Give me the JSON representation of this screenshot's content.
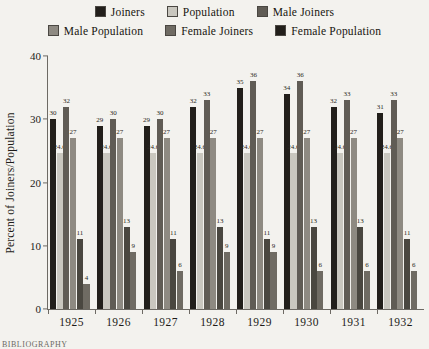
{
  "chart_data": {
    "type": "bar",
    "title": "",
    "xlabel": "",
    "ylabel": "Percent of Joiners/Population",
    "ylim": [
      0,
      40
    ],
    "yticks": [
      0,
      10,
      20,
      30,
      40
    ],
    "grid": false,
    "legend_position": "top",
    "categories": [
      "1925",
      "1926",
      "1927",
      "1928",
      "1929",
      "1930",
      "1931",
      "1932"
    ],
    "series": [
      {
        "name": "Joiners",
        "color": "#221f1b",
        "values": [
          30,
          29,
          29,
          32,
          35,
          34,
          32,
          31
        ],
        "labels": [
          "30",
          "29",
          "29",
          "32",
          "35",
          "34",
          "32",
          "31"
        ]
      },
      {
        "name": "Population",
        "color": "#c9c7bf",
        "values": [
          24.6,
          24.6,
          24.6,
          24.6,
          24.6,
          24.6,
          24.6,
          24.6
        ],
        "labels": [
          "24.6",
          "24.6",
          "24.6",
          "24.6",
          "24.6",
          "24.6",
          "24.6",
          "24.6"
        ]
      },
      {
        "name": "Male Joiners",
        "color": "#605c55",
        "values": [
          32,
          30,
          30,
          33,
          36,
          36,
          33,
          33
        ],
        "labels": [
          "32",
          "30",
          "30",
          "33",
          "36",
          "36",
          "33",
          "33"
        ]
      },
      {
        "name": "Male Population",
        "color": "#8e8a82",
        "values": [
          27,
          27,
          27,
          27,
          27,
          27,
          27,
          27
        ],
        "labels": [
          "27",
          "27",
          "27",
          "27",
          "27",
          "27",
          "27",
          "27"
        ]
      },
      {
        "name": "Female Joiners",
        "color": "#4a4740",
        "values": [
          11,
          13,
          11,
          13,
          11,
          13,
          13,
          11
        ],
        "labels": [
          "11",
          "13",
          "11",
          "13",
          "11",
          "13",
          "13",
          "11"
        ]
      },
      {
        "name": "Female Population",
        "color": "#6f6b63",
        "values": [
          4,
          9,
          6,
          9,
          9,
          6,
          6,
          6
        ],
        "labels": [
          "4",
          "9",
          "6",
          "9",
          "9",
          "6",
          "6",
          "6"
        ]
      }
    ]
  },
  "legend": {
    "rows": [
      [
        {
          "label": "Joiners",
          "color": "#221f1b"
        },
        {
          "label": "Population",
          "color": "#c9c7bf"
        },
        {
          "label": "Male Joiners",
          "color": "#605c55"
        }
      ],
      [
        {
          "label": "Male Population",
          "color": "#8e8a82"
        },
        {
          "label": "Female Joiners",
          "color": "#6f6b63"
        },
        {
          "label": "Female Population",
          "color": "#221f1b"
        }
      ]
    ]
  },
  "footnote": "BIBLIOGRAPHY"
}
